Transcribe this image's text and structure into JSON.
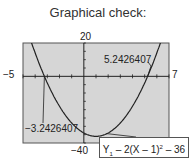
{
  "title": "Graphical check:",
  "chart_data": {
    "type": "line",
    "title": "Graphical check:",
    "function": "Y1 = 2(X - 1)^2 - 36",
    "window": {
      "xmin": -5,
      "xmax": 7,
      "ymin": -40,
      "ymax": 20
    },
    "tick_labels": {
      "ymax": "20",
      "ymin": "-40",
      "xmin": "-5",
      "xmax": "7"
    },
    "roots": [
      -3.2426407,
      5.2426407
    ],
    "root_labels": [
      "−3.2426407",
      "5.2426407"
    ],
    "vertex": {
      "x": 1,
      "y": -36
    },
    "annotation": "Y1 – 2(X – 1)² – 36",
    "grid": false,
    "colors": {
      "plot_bg": "#d6d6d6",
      "curve": "#222222",
      "axes": "#222222"
    }
  }
}
